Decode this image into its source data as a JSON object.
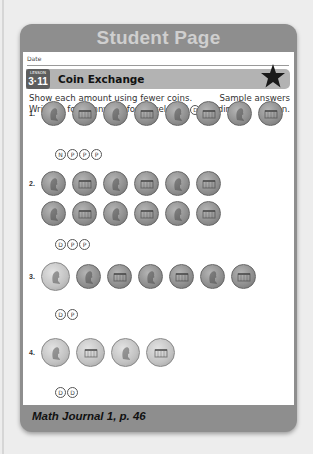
{
  "header": {
    "title": "Student Page"
  },
  "date_label": "Date",
  "lesson": {
    "badge_label": "LESSON",
    "number": "3·11",
    "title": "Coin Exchange",
    "icon": "star-icon"
  },
  "instructions": {
    "line1": "Show each amount using fewer coins.",
    "line2_prefix": "Write",
    "line2_p": "P",
    "line2_p_text": "for penny,",
    "line2_n": "N",
    "line2_n_text": "for nickel, and",
    "line2_d": "D",
    "line2_d_text": "for dime.",
    "note_line1": "Sample answers",
    "note_line2": "given."
  },
  "problems": [
    {
      "number": "1.",
      "coins": [
        "penny-heads",
        "penny-tails",
        "penny-heads",
        "penny-tails",
        "penny-heads",
        "penny-tails",
        "penny-heads",
        "penny-tails"
      ],
      "answer": [
        "N",
        "P",
        "P",
        "P"
      ]
    },
    {
      "number": "2.",
      "coins": [
        "penny-heads",
        "penny-tails",
        "penny-heads",
        "penny-tails",
        "penny-heads",
        "penny-tails",
        "penny-heads",
        "penny-tails",
        "penny-heads",
        "penny-tails",
        "penny-heads",
        "penny-tails"
      ],
      "answer": [
        "D",
        "P",
        "P"
      ]
    },
    {
      "number": "3.",
      "coins": [
        "nickel-heads",
        "penny-heads",
        "penny-tails",
        "penny-heads",
        "penny-tails",
        "penny-heads",
        "penny-tails"
      ],
      "answer": [
        "D",
        "P"
      ]
    },
    {
      "number": "4.",
      "coins": [
        "nickel-heads",
        "nickel-tails",
        "nickel-heads",
        "nickel-tails"
      ],
      "answer": [
        "D",
        "D"
      ]
    }
  ],
  "footer": {
    "text": "Math Journal 1, p. 46"
  },
  "colors": {
    "frame": "#8e8e8e",
    "header_text": "#cfcfcf",
    "lesson_bar": "#b3b3b3",
    "lesson_badge": "#5e5e5e",
    "page_bg": "#ededed"
  }
}
